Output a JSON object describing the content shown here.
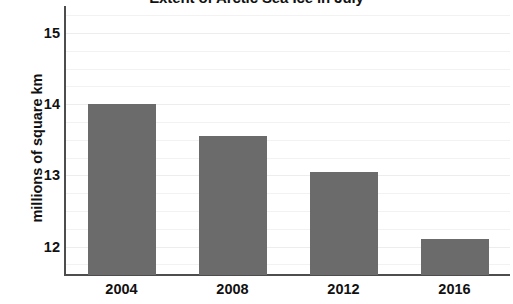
{
  "chart_data": {
    "type": "bar",
    "title": "Extent of Arctic Sea Ice in July",
    "xlabel": "",
    "ylabel": "millions of square km",
    "categories": [
      "2004",
      "2008",
      "2012",
      "2016"
    ],
    "values": [
      14.0,
      13.55,
      13.05,
      12.1
    ],
    "series": [
      {
        "name": "Arctic sea ice extent",
        "values": [
          14.0,
          13.55,
          13.05,
          12.1
        ]
      }
    ],
    "ylim": [
      11.6,
      15.35
    ],
    "ytick_labels": [
      "12",
      "13",
      "14",
      "15"
    ],
    "ytick_values": [
      12,
      13,
      14,
      15
    ],
    "gridlines": {
      "horizontal": true,
      "vertical": false,
      "minor_interval": 0.25
    },
    "legend": {
      "visible": false,
      "position": "none"
    },
    "colors": {
      "bar_fill": "#6b6b6b",
      "axis_line": "#4d4d4d",
      "gridline": "#f2f2f2",
      "gridline_major": "#ededed",
      "text": "#111111",
      "background": "#ffffff"
    }
  },
  "axes": {
    "y_title": "millions of square km",
    "y_ticks": [
      {
        "label": "15",
        "value": 15
      },
      {
        "label": "14",
        "value": 14
      },
      {
        "label": "13",
        "value": 13
      },
      {
        "label": "12",
        "value": 12
      }
    ],
    "x_ticks": [
      {
        "label": "2004"
      },
      {
        "label": "2008"
      },
      {
        "label": "2012"
      },
      {
        "label": "2016"
      }
    ]
  }
}
